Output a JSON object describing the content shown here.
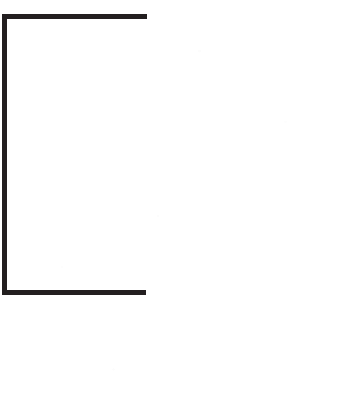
{
  "page": {
    "width": 344,
    "height": 393,
    "background_color": "#ffffff",
    "caption": ""
  },
  "drawing": {
    "name": "open-bracket",
    "description": "Large open square bracket shape",
    "stroke_color": "#231f20",
    "stroke_width": 5,
    "geometry": {
      "vertical_x": 4.5,
      "vertical_top_y": 14,
      "vertical_bottom_y": 296,
      "top_arm_y": 16.5,
      "top_arm_x_start": 2,
      "top_arm_x_end": 147,
      "bottom_arm_y": 292.5,
      "bottom_arm_x_start": 2,
      "bottom_arm_x_end": 146
    },
    "path": "M 147 16.5 L 4.5 16.5 L 4.5 292.5 L 146 292.5"
  }
}
